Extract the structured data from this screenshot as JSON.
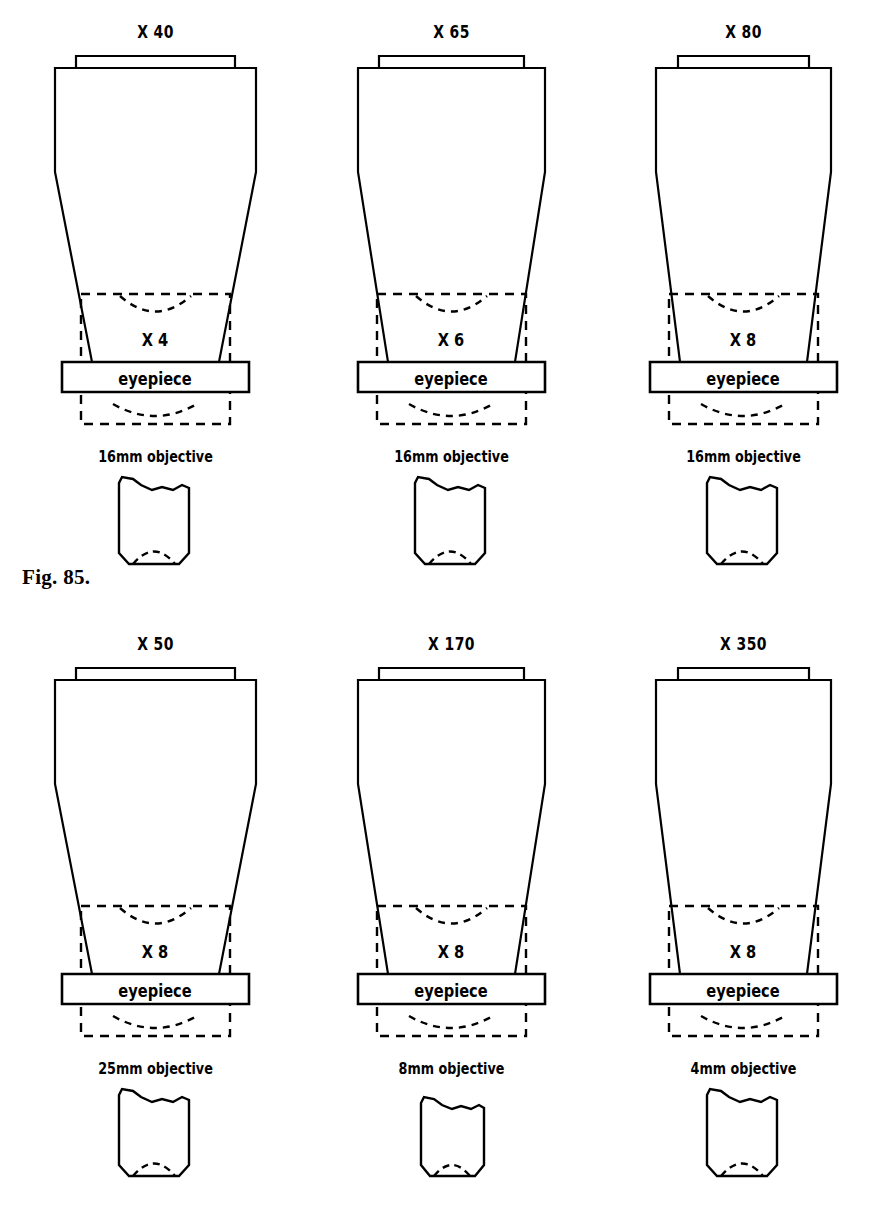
{
  "page": {
    "background_color": "#ffffff",
    "line_color": "#000000",
    "figures": [
      {
        "id": "fig85",
        "caption": "Fig. 85.",
        "units": [
          {
            "magnification_label": "X 40",
            "eyepiece_power": "X 4",
            "eyepiece_word": "eyepiece",
            "objective_label": "16mm  objective"
          },
          {
            "magnification_label": "X 65",
            "eyepiece_power": "X 6",
            "eyepiece_word": "eyepiece",
            "objective_label": "16mm  objective"
          },
          {
            "magnification_label": "X 80",
            "eyepiece_power": "X 8",
            "eyepiece_word": "eyepiece",
            "objective_label": "16mm  objective"
          }
        ]
      },
      {
        "id": "fig86",
        "caption": "Fig. 86.",
        "units": [
          {
            "magnification_label": "X 50",
            "eyepiece_power": "X 8",
            "eyepiece_word": "eyepiece",
            "objective_label": "25mm  objective"
          },
          {
            "magnification_label": "X 170",
            "eyepiece_power": "X 8",
            "eyepiece_word": "eyepiece",
            "objective_label": "8mm  objective"
          },
          {
            "magnification_label": "X 350",
            "eyepiece_power": "X 8",
            "eyepiece_word": "eyepiece",
            "objective_label": "4mm  objective"
          }
        ]
      }
    ]
  }
}
